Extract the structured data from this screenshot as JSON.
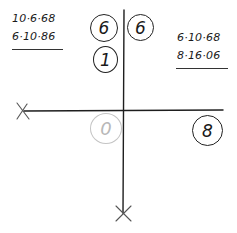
{
  "diagram": {
    "type": "quadrant-cross-sketch",
    "axes": {
      "horizontal": {
        "x1": 24,
        "y1": 111,
        "x2": 223,
        "y2": 110,
        "end_marker_left": "x-mark"
      },
      "vertical": {
        "x1": 124,
        "y1": 10,
        "x2": 123,
        "y2": 213,
        "end_marker_bottom": "x-mark"
      },
      "color": "#1e1e1e"
    },
    "dates_left": {
      "line1": "10·6·68",
      "line2": "6·10·86"
    },
    "dates_right": {
      "line1": "6·10·68",
      "line2": "8·16·06"
    },
    "circled_numbers": [
      {
        "id": "top-left-upper",
        "value": "6",
        "quadrant": "upper-left",
        "color": "#222222"
      },
      {
        "id": "top-left-lower",
        "value": "1",
        "quadrant": "upper-left",
        "color": "#222222"
      },
      {
        "id": "top-right",
        "value": "6",
        "quadrant": "upper-right",
        "color": "#222222"
      },
      {
        "id": "bottom-left",
        "value": "0",
        "quadrant": "lower-left",
        "color": "#b8b8b8"
      },
      {
        "id": "right-end",
        "value": "8",
        "quadrant": "lower-right",
        "color": "#222222"
      }
    ]
  }
}
